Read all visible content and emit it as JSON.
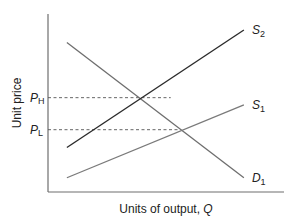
{
  "chart_data": {
    "type": "line",
    "title": "",
    "xlabel": "Units of output, Q",
    "xlabel_main": "Units of output, ",
    "xlabel_var": "Q",
    "ylabel": "Unit price",
    "xlim": [
      0,
      10
    ],
    "ylim": [
      0,
      10
    ],
    "grid": false,
    "legend": "none",
    "series": [
      {
        "name": "D1",
        "label_main": "D",
        "label_sub": "1",
        "points": [
          [
            0.8,
            8.4
          ],
          [
            8.3,
            0.8
          ]
        ]
      },
      {
        "name": "S2",
        "label_main": "S",
        "label_sub": "2",
        "points": [
          [
            0.8,
            2.5
          ],
          [
            8.3,
            9.1
          ]
        ]
      },
      {
        "name": "S1",
        "label_main": "S",
        "label_sub": "1",
        "points": [
          [
            0.8,
            0.8
          ],
          [
            8.3,
            4.9
          ]
        ]
      }
    ],
    "reference_lines": [
      {
        "name": "P_H",
        "label_main": "P",
        "label_sub": "H",
        "y": 5.3,
        "x_end": 5.2
      },
      {
        "name": "P_L",
        "label_main": "P",
        "label_sub": "L",
        "y": 3.5,
        "x_end": 5.6
      }
    ]
  }
}
